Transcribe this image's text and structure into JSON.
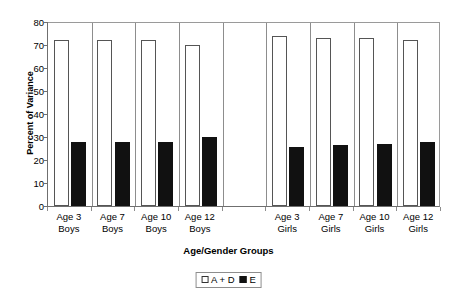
{
  "chart_data": {
    "type": "bar",
    "title": "",
    "xlabel": "Age/Gender Groups",
    "ylabel": "Percent of Variance",
    "ylim": [
      0,
      80
    ],
    "yticks": [
      0,
      10,
      20,
      30,
      40,
      50,
      60,
      70,
      80
    ],
    "grid": false,
    "legend_position": "bottom-center",
    "categories": [
      "Age 3 Boys",
      "Age 7 Boys",
      "Age 10 Boys",
      "Age 12 Boys",
      "",
      "Age 3 Girls",
      "Age 7 Girls",
      "Age 10 Girls",
      "Age 12 Girls"
    ],
    "category_lines": [
      [
        "Age 3",
        "Boys"
      ],
      [
        "Age 7",
        "Boys"
      ],
      [
        "Age 10",
        "Boys"
      ],
      [
        "Age 12",
        "Boys"
      ],
      [
        "",
        ""
      ],
      [
        "Age 3",
        "Girls"
      ],
      [
        "Age 7",
        "Girls"
      ],
      [
        "Age 10",
        "Girls"
      ],
      [
        "Age 12",
        "Girls"
      ]
    ],
    "series": [
      {
        "name": "A + D",
        "color": "#ffffff",
        "edge_color": "#555555",
        "values": [
          72,
          72,
          72,
          70,
          null,
          74,
          73,
          73,
          72
        ]
      },
      {
        "name": "E",
        "color": "#111111",
        "edge_color": "#111111",
        "values": [
          28,
          28,
          28,
          30,
          null,
          25.5,
          26.5,
          27,
          28
        ]
      }
    ]
  },
  "axis": {
    "y_title": "Percent of Variance",
    "x_title": "Age/Gender Groups",
    "y_tick_labels": [
      "80",
      "70",
      "60",
      "50",
      "40",
      "30",
      "20",
      "10",
      "0"
    ]
  },
  "legend": {
    "entries": [
      {
        "label": "A + D",
        "swatch": "white-square-icon"
      },
      {
        "label": "E",
        "swatch": "black-square-icon"
      }
    ]
  },
  "colors": {
    "bar_ad_fill": "#ffffff",
    "bar_ad_edge": "#555555",
    "bar_e_fill": "#111111",
    "axis_line": "#6f6f6f",
    "divider": "#8d8d8d",
    "background": "#ffffff"
  }
}
